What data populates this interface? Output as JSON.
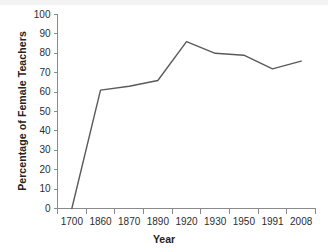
{
  "chart_data": {
    "type": "line",
    "title": "",
    "xlabel": "Year",
    "ylabel": "Percentage of Female Teachers",
    "categories": [
      "1700",
      "1860",
      "1870",
      "1890",
      "1920",
      "1930",
      "1950",
      "1991",
      "2008"
    ],
    "values": [
      0,
      61,
      63,
      66,
      86,
      80,
      79,
      72,
      76
    ],
    "series": [
      {
        "name": "Percentage of Female Teachers",
        "values": [
          0,
          61,
          63,
          66,
          86,
          80,
          79,
          72,
          76
        ]
      }
    ],
    "ylim": [
      0,
      100
    ],
    "ytick_labels": [
      "0",
      "10",
      "20",
      "30",
      "40",
      "50",
      "60",
      "70",
      "80",
      "90",
      "100"
    ],
    "ytick_values": [
      0,
      10,
      20,
      30,
      40,
      50,
      60,
      70,
      80,
      90,
      100
    ],
    "ytick_step": 10,
    "grid": false,
    "legend": "none",
    "line_color": "#5a5a5a",
    "axis_color": "#8a8a8a",
    "text_color": "#2d2d2d"
  }
}
